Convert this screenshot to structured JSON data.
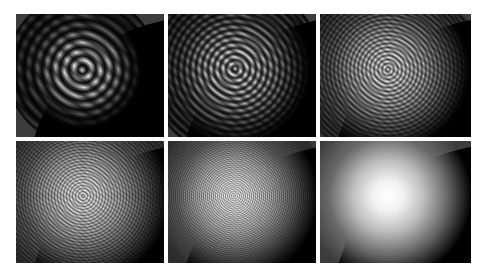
{
  "figure": {
    "layout": {
      "rows": 2,
      "columns": 3
    },
    "panels": [
      {
        "id": "panel-1",
        "row": 1,
        "col": 1,
        "texture": "coarse",
        "x": 16,
        "y": 14,
        "w": 148,
        "h": 123
      },
      {
        "id": "panel-2",
        "row": 1,
        "col": 2,
        "texture": "medium",
        "x": 168,
        "y": 14,
        "w": 148,
        "h": 123
      },
      {
        "id": "panel-3",
        "row": 1,
        "col": 3,
        "texture": "fine",
        "x": 320,
        "y": 14,
        "w": 151,
        "h": 123
      },
      {
        "id": "panel-4",
        "row": 2,
        "col": 1,
        "texture": "grainy",
        "x": 16,
        "y": 141,
        "w": 148,
        "h": 122
      },
      {
        "id": "panel-5",
        "row": 2,
        "col": 2,
        "texture": "very-fine",
        "x": 168,
        "y": 141,
        "w": 148,
        "h": 122
      },
      {
        "id": "panel-6",
        "row": 2,
        "col": 3,
        "texture": "smooth",
        "x": 320,
        "y": 141,
        "w": 151,
        "h": 122
      }
    ],
    "colors": {
      "background": "#ffffff",
      "panel": "#000000",
      "corner": "#3c3c3c",
      "highlight": "#ffffff"
    }
  }
}
